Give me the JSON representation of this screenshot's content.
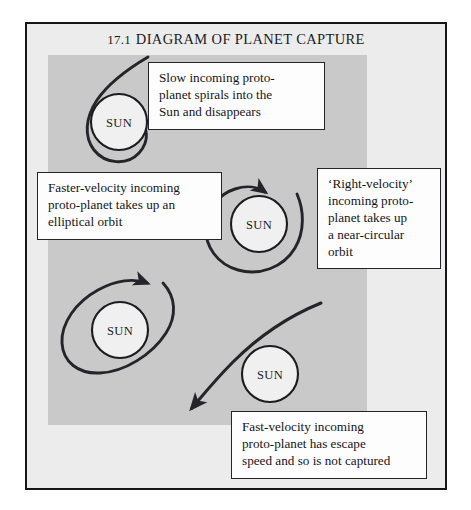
{
  "figure": {
    "number": "17.1",
    "title": "DIAGRAM OF PLANET CAPTURE"
  },
  "sun_label": "SUN",
  "suns": [
    {
      "name": "sun-spiral",
      "label": "SUN",
      "cx": 119,
      "cy": 122,
      "r": 28
    },
    {
      "name": "sun-circular",
      "label": "SUN",
      "cx": 259,
      "cy": 224,
      "r": 28
    },
    {
      "name": "sun-elliptical",
      "label": "SUN",
      "cx": 120,
      "cy": 330,
      "r": 28
    },
    {
      "name": "sun-escape",
      "label": "SUN",
      "cx": 270,
      "cy": 374,
      "r": 28
    }
  ],
  "callouts": [
    {
      "name": "callout-slow-incoming",
      "lines": [
        "Slow incoming proto-",
        "planet spirals into the",
        "Sun and disappears"
      ]
    },
    {
      "name": "callout-faster-velocity",
      "lines": [
        "Faster-velocity incoming",
        "proto-planet takes up an",
        "elliptical orbit"
      ]
    },
    {
      "name": "callout-right-velocity",
      "lines": [
        "‘Right-velocity’",
        "incoming proto-",
        "planet takes up",
        "a near-circular",
        "orbit"
      ]
    },
    {
      "name": "callout-fast-velocity",
      "lines": [
        "Fast-velocity incoming",
        "proto-planet has escape",
        "speed and so is not captured"
      ]
    }
  ],
  "trajectories": [
    {
      "name": "trajectory-spiral-capture",
      "description": "Slow incoming proto-planet spirals inward and is absorbed by the Sun",
      "outcome": "captured-absorbed"
    },
    {
      "name": "trajectory-elliptical-orbit",
      "description": "Faster-velocity proto-planet settles into an elliptical orbit",
      "outcome": "captured-elliptical"
    },
    {
      "name": "trajectory-circular-orbit",
      "description": "Right-velocity proto-planet settles into a near-circular orbit",
      "outcome": "captured-circular"
    },
    {
      "name": "trajectory-escape",
      "description": "Fast-velocity proto-planet has escape speed and is not captured",
      "outcome": "escaped"
    }
  ],
  "colors": {
    "page_background": "#ffffff",
    "frame_background": "#ececed",
    "panel_tint": "#c9c9ca",
    "ink": "#24242a",
    "callout_background": "#fdfdfd",
    "sun_fill": "#f0f0f0"
  }
}
